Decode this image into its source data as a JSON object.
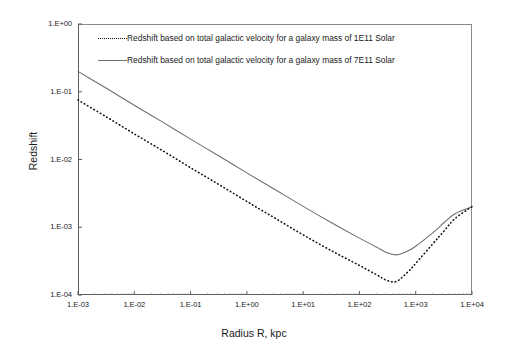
{
  "chart_data": {
    "type": "line",
    "title": "",
    "xlabel": "Radius R, kpc",
    "ylabel": "Redshift",
    "xscale": "log",
    "yscale": "log",
    "xlim": [
      0.001,
      10000
    ],
    "ylim": [
      0.0001,
      1
    ],
    "grid": false,
    "legend_position": "top-inside",
    "xticklabels": [
      "1.E-03",
      "1.E-02",
      "1.E-01",
      "1.E+00",
      "1.E+01",
      "1.E+02",
      "1.E+03",
      "1.E+04"
    ],
    "xtickvalues": [
      0.001,
      0.01,
      0.1,
      1,
      10,
      100,
      1000,
      10000
    ],
    "yticklabels": [
      "1.E-04",
      "1.E-03",
      "1.E-02",
      "1.E-01",
      "1.E+00"
    ],
    "ytickvalues": [
      0.0001,
      0.001,
      0.01,
      0.1,
      1
    ],
    "series": [
      {
        "name": "Redshift based on total galactic velocity for a galaxy mass of 1E11 Solar",
        "style": "dotted",
        "color": "#111111",
        "x": [
          0.001,
          0.0032,
          0.01,
          0.032,
          0.1,
          0.32,
          1,
          3.2,
          10,
          32,
          100,
          200,
          300,
          450,
          700,
          1000,
          2000,
          3200,
          5000,
          10000
        ],
        "y": [
          0.0755,
          0.0425,
          0.0239,
          0.01345,
          0.00757,
          0.00426,
          0.0024,
          0.001355,
          0.000772,
          0.000449,
          0.000273,
          0.0002,
          0.000166,
          0.000158,
          0.000213,
          0.000293,
          0.000566,
          0.000885,
          0.001345,
          0.00201
        ]
      },
      {
        "name": "Redshift based on total galactic velocity for a galaxy mass of 7E11 Solar",
        "style": "solid",
        "color": "#6e6e6e",
        "x": [
          0.001,
          0.0032,
          0.01,
          0.032,
          0.1,
          0.32,
          1,
          3.2,
          10,
          32,
          100,
          200,
          300,
          450,
          700,
          1000,
          2000,
          3200,
          5000,
          10000
        ],
        "y": [
          0.1998,
          0.1124,
          0.0632,
          0.0356,
          0.02,
          0.01127,
          0.00635,
          0.003585,
          0.002035,
          0.001168,
          0.000691,
          0.000511,
          0.000425,
          0.000391,
          0.000441,
          0.000525,
          0.000826,
          0.001175,
          0.001585,
          0.00201
        ]
      }
    ]
  },
  "legend": {
    "items": [
      {
        "label": "Redshift based on total galactic velocity for a galaxy mass of 1E11 Solar",
        "sample": "dotted-line-sample"
      },
      {
        "label": "Redshift based on total galactic velocity for a galaxy mass of 7E11 Solar",
        "sample": "solid-line-sample"
      }
    ]
  }
}
